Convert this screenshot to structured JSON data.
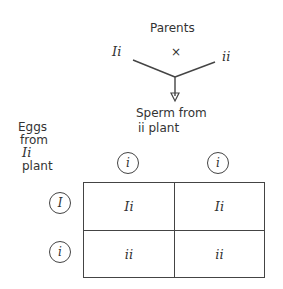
{
  "title": "Parents",
  "cross": {
    "parent_left": "Ii",
    "symbol": "×",
    "parent_right": "ii"
  },
  "sperm_label": {
    "line1": "Sperm from",
    "line2": "ii plant"
  },
  "eggs_label": {
    "line1": "Eggs",
    "line2": "from",
    "line3": "Ii",
    "line4": "plant"
  },
  "punnett": {
    "column_alleles": [
      "i",
      "i"
    ],
    "row_alleles": [
      "I",
      "i"
    ],
    "cells": [
      [
        "Ii",
        "Ii"
      ],
      [
        "ii",
        "ii"
      ]
    ]
  }
}
